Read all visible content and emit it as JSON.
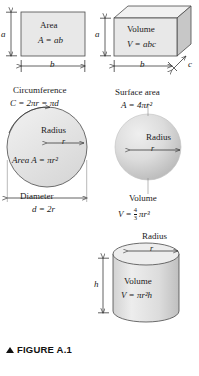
{
  "figure": {
    "caption_marker": "▲",
    "caption": "FIGURE A.1"
  },
  "colors": {
    "fill_flat": "#e6e6e6",
    "fill_top": "#f0f0f0",
    "fill_side": "#c9c9c9",
    "stroke": "#3a3a3a",
    "text": "#111111"
  },
  "panels": {
    "rectangle": {
      "label_title": "Area",
      "formula": "A = ab",
      "dim_height": "a",
      "dim_width": "b"
    },
    "box": {
      "label_title": "Volume",
      "formula": "V = abc",
      "dim_height": "a",
      "dim_width": "b",
      "dim_depth": "c"
    },
    "circle": {
      "title": "Circumference",
      "title_formula": "C = 2πr = πd",
      "radius_label": "Radius",
      "radius_symbol": "r",
      "area_formula": "Area A = πr²",
      "diameter_label": "Diameter",
      "diameter_formula": "d = 2r"
    },
    "sphere": {
      "title": "Surface area",
      "title_formula": "A = 4πr²",
      "radius_label": "Radius",
      "radius_symbol": "r",
      "volume_label": "Volume",
      "volume_formula_lead": "V =",
      "volume_frac_num": "4",
      "volume_frac_den": "3",
      "volume_formula_tail": "πr³"
    },
    "cylinder": {
      "radius_label": "Radius",
      "radius_symbol": "r",
      "height_symbol": "h",
      "volume_label": "Volume",
      "volume_formula": "V = πr²h"
    }
  }
}
